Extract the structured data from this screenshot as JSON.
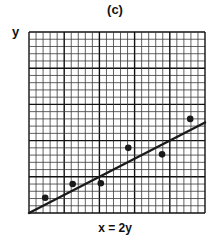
{
  "figure": {
    "panel_label": "(c)",
    "y_axis_label": "y",
    "x_axis_caption": "x = 2y"
  },
  "colors": {
    "ink": "#1a1a1a",
    "minor_grid": "#3a3a3a",
    "major_grid": "#111111",
    "background": "#ffffff"
  },
  "chart_data": {
    "type": "scatter",
    "title": "(c)",
    "xlabel": "",
    "ylabel": "y",
    "caption": "x = 2y",
    "grid": true,
    "grid_minor_divisions": 25,
    "grid_major_every": 5,
    "xlim": [
      0,
      25
    ],
    "ylim": [
      0,
      25
    ],
    "series": [
      {
        "name": "data points",
        "type": "scatter",
        "points": [
          {
            "x": 2.3,
            "y": 2.1
          },
          {
            "x": 6.2,
            "y": 4.0
          },
          {
            "x": 10.2,
            "y": 4.1
          },
          {
            "x": 14.1,
            "y": 9.0
          },
          {
            "x": 18.9,
            "y": 8.1
          },
          {
            "x": 22.9,
            "y": 13.0
          }
        ]
      },
      {
        "name": "fit line x = 2y",
        "type": "line",
        "points": [
          {
            "x": 0,
            "y": 0
          },
          {
            "x": 25,
            "y": 12.5
          }
        ]
      }
    ],
    "legend": null
  }
}
